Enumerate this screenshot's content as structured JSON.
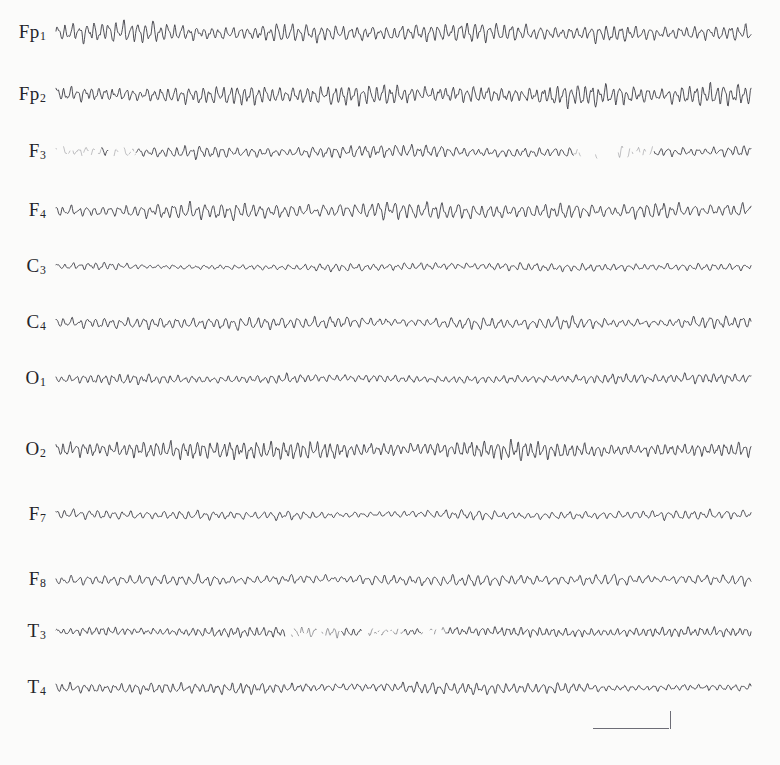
{
  "figure": {
    "background_color": "#fbfbfa",
    "trace_color": "#3c3c44",
    "calibration_color": "#6d6d76"
  },
  "calibration": {
    "name": "calibration-marker",
    "horizontal_label": "",
    "vertical_label": "",
    "x_start_px": 593,
    "x_end_px": 669,
    "tick_height_px": 18
  },
  "chart_data": {
    "type": "line",
    "title": "",
    "subtitle": "",
    "xlabel": "",
    "ylabel": "",
    "grid": false,
    "legend_position": "left-axis-labels",
    "plot_area": {
      "x_start_px": 56,
      "x_end_px": 751,
      "y_top_px": 10,
      "y_bottom_px": 706
    },
    "xlim": [
      0,
      1
    ],
    "annotations": [
      "Scale/calibration bar at lower right (no printed units)"
    ],
    "series": [
      {
        "name": "Fp1",
        "label": "Fp",
        "subscript": "1",
        "baseline_y_px": 33,
        "amplitude": 10.5,
        "frequency": 95,
        "phase": 0.0,
        "quality": "clean",
        "seed": 11,
        "description": "Continuous medium-amplitude fast rhythm across full epoch"
      },
      {
        "name": "Fp2",
        "label": "Fp",
        "subscript": "2",
        "baseline_y_px": 95,
        "amplitude": 11.5,
        "frequency": 100,
        "phase": 0.7,
        "quality": "clean",
        "seed": 23,
        "description": "Highest amplitude frontal rhythm, continuous"
      },
      {
        "name": "F3",
        "label": "F",
        "subscript": "3",
        "baseline_y_px": 152,
        "amplitude": 7.0,
        "frequency": 92,
        "phase": 1.4,
        "quality": "broken",
        "seed": 37,
        "faded_spans": [
          [
            0.0,
            0.065
          ],
          [
            0.075,
            0.115
          ],
          [
            0.745,
            0.86
          ]
        ],
        "description": "Attenuated start and a faded dotted segment near right third"
      },
      {
        "name": "F4",
        "label": "F",
        "subscript": "4",
        "baseline_y_px": 211,
        "amplitude": 8.5,
        "frequency": 88,
        "phase": 2.1,
        "quality": "clean",
        "seed": 41,
        "description": "Moderate amplitude continuous activity"
      },
      {
        "name": "C3",
        "label": "C",
        "subscript": "3",
        "baseline_y_px": 267,
        "amplitude": 4.0,
        "frequency": 90,
        "phase": 0.4,
        "quality": "clean",
        "seed": 53,
        "description": "Lowest amplitude, nearly flat central trace"
      },
      {
        "name": "C4",
        "label": "C",
        "subscript": "4",
        "baseline_y_px": 323,
        "amplitude": 6.5,
        "frequency": 86,
        "phase": 1.9,
        "quality": "clean",
        "seed": 67,
        "description": "Low-moderate amplitude central trace"
      },
      {
        "name": "O1",
        "label": "O",
        "subscript": "1",
        "baseline_y_px": 379,
        "amplitude": 5.0,
        "frequency": 96,
        "phase": 2.6,
        "quality": "clean",
        "seed": 71,
        "description": "Low amplitude occipital trace"
      },
      {
        "name": "O2",
        "label": "O",
        "subscript": "2",
        "baseline_y_px": 450,
        "amplitude": 10.0,
        "frequency": 104,
        "phase": 0.9,
        "quality": "clean",
        "seed": 83,
        "description": "Prominent occipital alpha rhythm, high amplitude"
      },
      {
        "name": "F7",
        "label": "F",
        "subscript": "7",
        "amplitude": 5.5,
        "baseline_y_px": 515,
        "frequency": 84,
        "phase": 1.2,
        "quality": "clean",
        "seed": 97,
        "description": "Low amplitude anterior temporal trace"
      },
      {
        "name": "F8",
        "label": "F",
        "subscript": "8",
        "baseline_y_px": 580,
        "amplitude": 6.0,
        "frequency": 82,
        "phase": 3.0,
        "quality": "clean",
        "seed": 103,
        "description": "Low amplitude with a slower wave near right of epoch"
      },
      {
        "name": "T3",
        "label": "T",
        "subscript": "3",
        "baseline_y_px": 632,
        "amplitude": 5.0,
        "frequency": 108,
        "phase": 0.2,
        "quality": "speckled",
        "seed": 113,
        "faded_spans": [
          [
            0.33,
            0.41
          ],
          [
            0.44,
            0.5
          ],
          [
            0.525,
            0.56
          ]
        ],
        "description": "Mid-epoch signal dropout / dotted ink breakup"
      },
      {
        "name": "T4",
        "label": "T",
        "subscript": "4",
        "baseline_y_px": 688,
        "amplitude": 6.0,
        "frequency": 94,
        "phase": 2.3,
        "quality": "clean",
        "seed": 127,
        "description": "Moderate low amplitude, continuous"
      }
    ]
  }
}
